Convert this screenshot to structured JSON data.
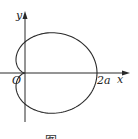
{
  "figure": {
    "type": "cardioid",
    "equation": "r = a(1 + cos θ)",
    "labels": {
      "y_axis": "y",
      "x_axis": "x",
      "origin": "O",
      "x_intercept": "2a"
    },
    "caption": "图"
  },
  "colors": {
    "stroke": "#2a2a2a",
    "background": "#ffffff"
  }
}
